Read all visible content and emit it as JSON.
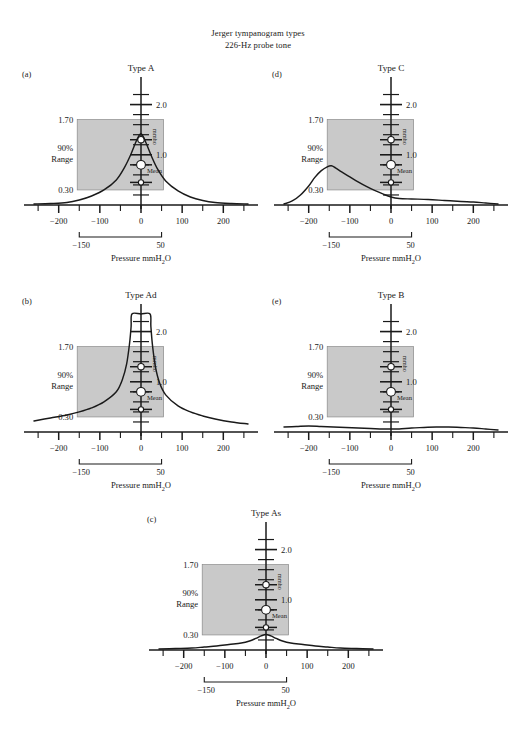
{
  "figure": {
    "title_line1": "Jerger tympanogram types",
    "title_line2": "226-Hz probe tone",
    "top_cut_text": "",
    "bottom_cut_text": ""
  },
  "axes_common": {
    "x_label": "Pressure mmH",
    "x_label_sub": "2",
    "x_label_tail": "O",
    "x_ticks": [
      "-200",
      "-100",
      "0",
      "100",
      "200"
    ],
    "x_tick_values": [
      -200,
      -100,
      0,
      100,
      200
    ],
    "x_minor_values": [
      -250,
      -200,
      -150,
      -100,
      -50,
      0,
      50,
      100,
      150,
      200,
      250
    ],
    "x_range": [
      -260,
      260
    ],
    "y_label": "mmho",
    "y_ticks": [
      "2.0",
      "1.0"
    ],
    "y_tick_values": [
      2.0,
      1.0
    ],
    "y_range": [
      0,
      2.35
    ],
    "range_box_top_label": "1.70",
    "range_box_bottom_label": "0.30",
    "range_box_name_line1": "90%",
    "range_box_name_line2": "Range",
    "range_box_top_value": 1.7,
    "range_box_bottom_value": 0.3,
    "range_box_x_left": -155,
    "range_box_x_right": 55,
    "range_box_color": "#c9c9c9",
    "bracket_left_label": "-150",
    "bracket_right_label": "50",
    "bracket_left_value": -150,
    "bracket_right_value": 50,
    "mean_label": "Mean",
    "marker_values": [
      1.3,
      0.8,
      0.45
    ],
    "marker_sizes": [
      3.2,
      4.4,
      2.6
    ],
    "marker_fill": "#ffffff",
    "curve_color": "#1a1a1a"
  },
  "chart_data": {
    "type": "line",
    "xlabel": "Pressure mmH2O",
    "ylabel": "mmho",
    "xlim": [
      -260,
      260
    ],
    "ylim": [
      0,
      2.35
    ],
    "grid": false,
    "legend": "none",
    "shared_annotations": {
      "shaded_90pct_range": {
        "y_top": 1.7,
        "y_bottom": 0.3,
        "x_left": -155,
        "x_right": 55
      },
      "normative_markers_mmho": [
        1.3,
        0.8,
        0.45
      ],
      "pressure_bracket_mmH2O": [
        -150,
        50
      ]
    },
    "panels": [
      {
        "key": "a",
        "panel_label": "(a)",
        "title": "Type A",
        "description": "Normal: single sharp peak at 0 daPa reaching ~1.4 mmho",
        "x": [
          -260,
          -220,
          -180,
          -150,
          -120,
          -90,
          -60,
          -40,
          -25,
          -10,
          0,
          10,
          25,
          40,
          60,
          90,
          120,
          150,
          180,
          220,
          260
        ],
        "y": [
          0.02,
          0.03,
          0.05,
          0.1,
          0.18,
          0.3,
          0.5,
          0.75,
          1.0,
          1.3,
          1.42,
          1.28,
          0.98,
          0.72,
          0.48,
          0.28,
          0.16,
          0.09,
          0.05,
          0.03,
          0.02
        ]
      },
      {
        "key": "b",
        "panel_label": "(b)",
        "title": "Type Ad",
        "description": "Hypercompliant: very tall narrow peak exceeding scale at 0 daPa",
        "x": [
          -260,
          -220,
          -180,
          -150,
          -120,
          -90,
          -60,
          -45,
          -35,
          -28,
          -24,
          -22,
          0,
          22,
          24,
          28,
          35,
          45,
          60,
          90,
          120,
          150,
          180,
          220,
          260
        ],
        "y": [
          0.22,
          0.28,
          0.34,
          0.4,
          0.48,
          0.6,
          0.8,
          1.05,
          1.35,
          1.75,
          2.1,
          2.35,
          2.35,
          2.35,
          2.1,
          1.72,
          1.3,
          0.98,
          0.74,
          0.52,
          0.4,
          0.32,
          0.26,
          0.2,
          0.16
        ]
      },
      {
        "key": "c",
        "panel_label": "(c)",
        "title": "Type As",
        "description": "Shallow: low-amplitude peak at 0 daPa reaching ~0.30 mmho",
        "x": [
          -260,
          -220,
          -180,
          -150,
          -120,
          -90,
          -60,
          -40,
          -25,
          -12,
          0,
          12,
          25,
          40,
          60,
          90,
          120,
          150,
          180,
          220,
          260
        ],
        "y": [
          0.02,
          0.03,
          0.04,
          0.06,
          0.08,
          0.11,
          0.14,
          0.18,
          0.23,
          0.28,
          0.31,
          0.28,
          0.23,
          0.18,
          0.14,
          0.11,
          0.08,
          0.06,
          0.04,
          0.03,
          0.02
        ]
      },
      {
        "key": "d",
        "panel_label": "(d)",
        "title": "Type C",
        "description": "Negative pressure: peak shifted to about -150 daPa, ~0.75 mmho",
        "x": [
          -260,
          -240,
          -220,
          -200,
          -185,
          -170,
          -155,
          -145,
          -135,
          -120,
          -100,
          -80,
          -60,
          -40,
          -20,
          0,
          20,
          50,
          90,
          130,
          170,
          200,
          230,
          260
        ],
        "y": [
          0.02,
          0.08,
          0.2,
          0.38,
          0.55,
          0.68,
          0.76,
          0.78,
          0.74,
          0.66,
          0.56,
          0.46,
          0.37,
          0.29,
          0.22,
          0.16,
          0.13,
          0.12,
          0.11,
          0.09,
          0.07,
          0.06,
          0.04,
          0.02
        ]
      },
      {
        "key": "e",
        "panel_label": "(e)",
        "title": "Type B",
        "description": "Flat: no discernible peak across the pressure sweep",
        "x": [
          -260,
          -230,
          -200,
          -170,
          -140,
          -110,
          -80,
          -50,
          -20,
          0,
          20,
          50,
          80,
          110,
          140,
          170,
          200,
          230,
          260
        ],
        "y": [
          0.1,
          0.11,
          0.12,
          0.11,
          0.1,
          0.09,
          0.08,
          0.07,
          0.06,
          0.06,
          0.06,
          0.08,
          0.09,
          0.1,
          0.1,
          0.09,
          0.08,
          0.06,
          0.04
        ]
      }
    ]
  }
}
